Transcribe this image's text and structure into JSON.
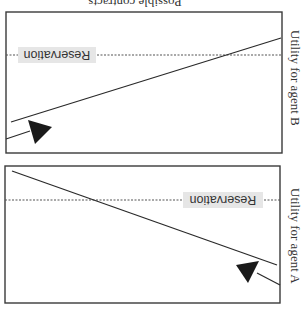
{
  "figure": {
    "orientation": "rotated-180",
    "caption_top": "Possible contracts",
    "colors": {
      "frame": "#3a3a3a",
      "line": "#2a2a2a",
      "reservation": "#555555",
      "label_bg": "#e6e6e6",
      "arrow": "#1a1a1a"
    }
  },
  "panels": [
    {
      "id": "agent-b",
      "axis_label": "Utility for agent B",
      "reservation_label": "Reservation",
      "frame": {
        "x": 6,
        "y": 12,
        "w": 276,
        "h": 141
      },
      "reservation_y": 55,
      "reservation_label_box": {
        "x": 18,
        "y": 47,
        "w": 78,
        "h": 16
      },
      "line_main": {
        "x1": 11,
        "y1": 122,
        "x2": 281,
        "y2": 38
      },
      "line_short": {
        "x1": 6,
        "y1": 139,
        "x2": 30,
        "y2": 131
      },
      "arrow": "28,120 52,127 35,144",
      "axis_label_pos": {
        "x": 295,
        "y": 30
      }
    },
    {
      "id": "agent-a",
      "axis_label": "Utility for agent A",
      "reservation_label": "Reservation",
      "frame": {
        "x": 5,
        "y": 166,
        "w": 275,
        "h": 137
      },
      "reservation_y": 200,
      "reservation_label_box": {
        "x": 183,
        "y": 192,
        "w": 80,
        "h": 16
      },
      "line_main": {
        "x1": 12,
        "y1": 171,
        "x2": 277,
        "y2": 265
      },
      "line_short": {
        "x1": 257,
        "y1": 273,
        "x2": 280,
        "y2": 285
      },
      "arrow": "236,265 259,261 248,283",
      "axis_label_pos": {
        "x": 295,
        "y": 188
      }
    }
  ]
}
